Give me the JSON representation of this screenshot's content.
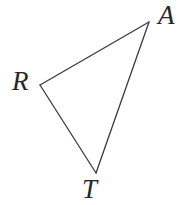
{
  "figure": {
    "kind": "geometry-triangle",
    "width": 193,
    "height": 205,
    "background_color": "#ffffff",
    "stroke_color": "#3a3a40",
    "stroke_width": 1.3,
    "label_color": "#26262b"
  },
  "vertices": [
    {
      "id": "A",
      "label": "A",
      "x": 149,
      "y": 22,
      "label_x": 158,
      "label_y": 2
    },
    {
      "id": "R",
      "label": "R",
      "x": 40,
      "y": 85,
      "label_x": 12,
      "label_y": 68
    },
    {
      "id": "T",
      "label": "T",
      "x": 96,
      "y": 173,
      "label_x": 82,
      "label_y": 176
    }
  ],
  "edges": [
    {
      "id": "RA",
      "from": "R",
      "to": "A",
      "path": "M 40 85 L 149 22"
    },
    {
      "id": "AT",
      "from": "A",
      "to": "T",
      "path": "M 149 22 L 96 173"
    },
    {
      "id": "TR",
      "from": "T",
      "to": "R",
      "path": "M 96 173 L 40 85"
    }
  ],
  "outline_path": "M 40 85 L 149 22 L 96 173 Z"
}
